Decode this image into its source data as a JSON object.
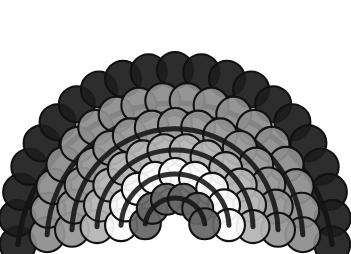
{
  "figure": {
    "name": "concentric-circle-rainbow",
    "background_color": "#ffffff",
    "canvas": {
      "width": 351,
      "height": 254
    },
    "arc_center": {
      "x": 175,
      "y": 228
    },
    "circle_outline_color": "#111111",
    "circle_outline_width": 2.1,
    "arc_stroke_color": "#141414",
    "arc_stroke_width": 5.0,
    "arcs": [
      {
        "index": 1,
        "name": "arc-outer-black",
        "fill_color": "#1d1d1d",
        "radius": 158,
        "circle_diameter": 36,
        "circle_count": 21,
        "start_angle_deg": 186,
        "end_angle_deg": -6
      },
      {
        "index": 2,
        "name": "arc-mid-gray-outer",
        "fill_color": "#8d8d8d",
        "radius": 128,
        "circle_diameter": 35,
        "circle_count": 18,
        "start_angle_deg": 183,
        "end_angle_deg": -3
      },
      {
        "index": 3,
        "name": "arc-gray",
        "fill_color": "#969696",
        "radius": 103,
        "circle_diameter": 34,
        "circle_count": 15,
        "start_angle_deg": 181,
        "end_angle_deg": -1
      },
      {
        "index": 4,
        "name": "arc-light-gray",
        "fill_color": "#b4b4b4",
        "radius": 78,
        "circle_diameter": 33,
        "circle_count": 12,
        "start_angle_deg": 179,
        "end_angle_deg": 1
      },
      {
        "index": 5,
        "name": "arc-white",
        "fill_color": "#fbfbfb",
        "radius": 54,
        "circle_diameter": 32,
        "circle_count": 9,
        "start_angle_deg": 177,
        "end_angle_deg": 3
      },
      {
        "index": 6,
        "name": "arc-inner-dark-gray",
        "fill_color": "#666666",
        "radius": 30,
        "circle_diameter": 31,
        "circle_count": 6,
        "start_angle_deg": 172,
        "end_angle_deg": 8
      }
    ]
  }
}
